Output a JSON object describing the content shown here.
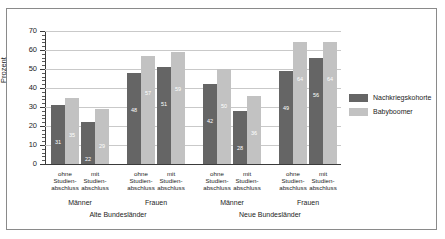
{
  "chart_data": {
    "type": "bar",
    "title": "",
    "subtitle": "",
    "xlabel": "",
    "ylabel": "Prozent",
    "ylim": [
      0,
      70
    ],
    "ytick_step": 10,
    "yticks": [
      "0",
      "10",
      "20",
      "30",
      "40",
      "50",
      "60",
      "70"
    ],
    "grid": true,
    "legend_position": "right",
    "categories": [
      "ohne\nStudien-\nabschluss",
      "mit\nStudien-\nabschluss",
      "ohne\nStudien-\nabschluss",
      "mit\nStudien-\nabschluss",
      "ohne\nStudien-\nabschluss",
      "mit\nStudien-\nabschluss",
      "ohne\nStudien-\nabschluss",
      "mit\nStudien-\nabschluss"
    ],
    "series": [
      {
        "name": "Nachkriegskohorte",
        "color": "#656565",
        "values": [
          31,
          22,
          48,
          51,
          42,
          28,
          49,
          56
        ]
      },
      {
        "name": "Babyboomer",
        "color": "#c2c2c2",
        "values": [
          35,
          29,
          57,
          59,
          50,
          36,
          64,
          64
        ]
      }
    ],
    "group_labels": [
      "Männer",
      "Frauen",
      "Männer",
      "Frauen"
    ],
    "region_labels": [
      "Alte Bundesländer",
      "Neue Bundesländer"
    ]
  },
  "legend": {
    "items": [
      {
        "label": "Nachkriegskohorte",
        "color": "#656565"
      },
      {
        "label": "Babyboomer",
        "color": "#c2c2c2"
      }
    ]
  },
  "axis": {
    "y_title": "Prozent",
    "y_labels": [
      "70",
      "60",
      "50",
      "40",
      "30",
      "20",
      "10",
      "0"
    ]
  }
}
